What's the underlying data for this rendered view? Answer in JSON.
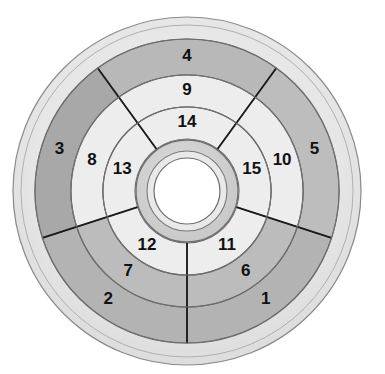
{
  "caption": {
    "text": "computer. Randomising the complete"
  },
  "chart_data": {
    "type": "pie",
    "subtype": "sunburst-wheel",
    "center": {
      "x": 187,
      "y": 191
    },
    "rings": [
      {
        "index": 0,
        "name": "outer-border-ring",
        "r_inner": 152,
        "r_outer": 175,
        "fill": "#e3e3e3",
        "labelled": false
      },
      {
        "index": 1,
        "name": "ring-outer-data",
        "r_inner": 116,
        "r_outer": 152,
        "labelled": true
      },
      {
        "index": 2,
        "name": "ring-middle-data",
        "r_inner": 84,
        "r_outer": 116,
        "labelled": true
      },
      {
        "index": 3,
        "name": "ring-inner-data",
        "r_inner": 52,
        "r_outer": 84,
        "labelled": true
      },
      {
        "index": 4,
        "name": "hub-ring",
        "r_inner": 38,
        "r_outer": 52,
        "fill": "#d0d0d0",
        "labelled": false
      },
      {
        "index": 5,
        "name": "center-hole",
        "r_inner": 0,
        "r_outer": 34,
        "fill": "#ffffff",
        "labelled": false
      }
    ],
    "sectors": [
      {
        "name": "sector-top",
        "start_deg": -126,
        "end_deg": -54,
        "label_deg": -90
      },
      {
        "name": "sector-right",
        "start_deg": -54,
        "end_deg": 18,
        "label_deg": -18
      },
      {
        "name": "sector-bottom-right",
        "start_deg": 18,
        "end_deg": 90,
        "label_deg": 54
      },
      {
        "name": "sector-bottom-left",
        "start_deg": 90,
        "end_deg": 162,
        "label_deg": 126
      },
      {
        "name": "sector-left",
        "start_deg": 162,
        "end_deg": 234,
        "label_deg": 198
      }
    ],
    "segments": [
      {
        "id": 1,
        "label": "1",
        "sector": "sector-bottom-right",
        "ring": 1,
        "fill": "#b3b3b3"
      },
      {
        "id": 2,
        "label": "2",
        "sector": "sector-bottom-left",
        "ring": 1,
        "fill": "#b3b3b3"
      },
      {
        "id": 3,
        "label": "3",
        "sector": "sector-left",
        "ring": 1,
        "fill": "#a8a8a8"
      },
      {
        "id": 4,
        "label": "4",
        "sector": "sector-top",
        "ring": 1,
        "fill": "#b8b8b8"
      },
      {
        "id": 5,
        "label": "5",
        "sector": "sector-right",
        "ring": 1,
        "fill": "#bdbdbd"
      },
      {
        "id": 6,
        "label": "6",
        "sector": "sector-bottom-right",
        "ring": 2,
        "fill": "#bcbcbc"
      },
      {
        "id": 7,
        "label": "7",
        "sector": "sector-bottom-left",
        "ring": 2,
        "fill": "#bcbcbc"
      },
      {
        "id": 8,
        "label": "8",
        "sector": "sector-left",
        "ring": 2,
        "fill": "#ededed"
      },
      {
        "id": 9,
        "label": "9",
        "sector": "sector-top",
        "ring": 2,
        "fill": "#ededed"
      },
      {
        "id": 10,
        "label": "10",
        "sector": "sector-right",
        "ring": 2,
        "fill": "#ededed"
      },
      {
        "id": 11,
        "label": "11",
        "sector": "sector-bottom-right",
        "ring": 3,
        "fill": "#ededed"
      },
      {
        "id": 12,
        "label": "12",
        "sector": "sector-bottom-left",
        "ring": 3,
        "fill": "#ededed"
      },
      {
        "id": 13,
        "label": "13",
        "sector": "sector-left",
        "ring": 3,
        "fill": "#ededed"
      },
      {
        "id": 14,
        "label": "14",
        "sector": "sector-top",
        "ring": 3,
        "fill": "#ededed"
      },
      {
        "id": 15,
        "label": "15",
        "sector": "sector-right",
        "ring": 3,
        "fill": "#ededed"
      }
    ],
    "label_radii": {
      "1": 134,
      "2": 100,
      "3": 68
    },
    "colors": {
      "outer_border_ring": "#e3e3e3",
      "light_segment": "#ededed",
      "mid_segment": "#bcbcbc",
      "dark_segment": "#a8a8a8",
      "hub": "#d0d0d0",
      "hole": "#ffffff",
      "stroke": "#6e6e6e",
      "divider": "#1a1a1a",
      "label_text": "#111111",
      "background": "#ffffff"
    },
    "grid": false,
    "legend": "none"
  }
}
